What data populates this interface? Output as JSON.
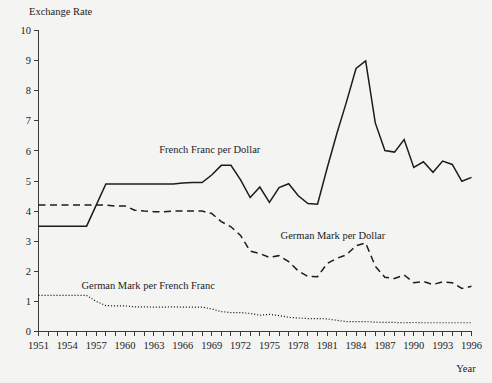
{
  "chart_data": {
    "type": "line",
    "title": "",
    "ylabel": "Exchange Rate",
    "xlabel": "Year",
    "ylim": [
      0,
      10
    ],
    "xlim": [
      1951,
      1996
    ],
    "grid": false,
    "legend_position": "inline-annotations",
    "ytick_labels": [
      "0",
      "1",
      "2",
      "3",
      "4",
      "5",
      "6",
      "7",
      "8",
      "9",
      "10"
    ],
    "ytick_values": [
      0,
      1,
      2,
      3,
      4,
      5,
      6,
      7,
      8,
      9,
      10
    ],
    "xtick_labels": [
      "1951",
      "1954",
      "1957",
      "1960",
      "1963",
      "1966",
      "1969",
      "1972",
      "1975",
      "1978",
      "1981",
      "1984",
      "1987",
      "1990",
      "1993",
      "1996"
    ],
    "xtick_values": [
      1951,
      1954,
      1957,
      1960,
      1963,
      1966,
      1969,
      1972,
      1975,
      1978,
      1981,
      1984,
      1987,
      1990,
      1993,
      1996
    ],
    "x": [
      1951,
      1952,
      1953,
      1954,
      1955,
      1956,
      1957,
      1958,
      1959,
      1960,
      1961,
      1962,
      1963,
      1964,
      1965,
      1966,
      1967,
      1968,
      1969,
      1970,
      1971,
      1972,
      1973,
      1974,
      1975,
      1976,
      1977,
      1978,
      1979,
      1980,
      1981,
      1982,
      1983,
      1984,
      1985,
      1986,
      1987,
      1988,
      1989,
      1990,
      1991,
      1992,
      1993,
      1994,
      1995,
      1996
    ],
    "series": [
      {
        "name": "French Franc per Dollar",
        "style": "solid",
        "label_text": "French Franc per Dollar",
        "values": [
          3.5,
          3.5,
          3.5,
          3.5,
          3.5,
          3.5,
          4.2,
          4.9,
          4.9,
          4.9,
          4.9,
          4.9,
          4.9,
          4.9,
          4.9,
          4.93,
          4.95,
          4.95,
          5.2,
          5.52,
          5.52,
          5.04,
          4.45,
          4.8,
          4.29,
          4.78,
          4.91,
          4.51,
          4.25,
          4.23,
          5.43,
          6.57,
          7.62,
          8.74,
          8.99,
          6.93,
          6.01,
          5.96,
          6.38,
          5.45,
          5.64,
          5.29,
          5.66,
          5.55,
          4.99,
          5.12
        ]
      },
      {
        "name": "German Mark per Dollar",
        "style": "dashed",
        "label_text": "German Mark per Dollar",
        "values": [
          4.2,
          4.2,
          4.2,
          4.2,
          4.2,
          4.2,
          4.2,
          4.2,
          4.17,
          4.17,
          4.03,
          4.0,
          3.98,
          3.98,
          4.0,
          4.0,
          4.0,
          4.0,
          3.92,
          3.65,
          3.48,
          3.19,
          2.67,
          2.59,
          2.46,
          2.52,
          2.32,
          2.01,
          1.83,
          1.82,
          2.26,
          2.43,
          2.55,
          2.85,
          2.94,
          2.17,
          1.8,
          1.76,
          1.88,
          1.62,
          1.66,
          1.56,
          1.65,
          1.62,
          1.43,
          1.5
        ]
      },
      {
        "name": "German Mark per French Franc",
        "style": "dotted",
        "label_text": "German Mark per French Franc",
        "values": [
          1.2,
          1.2,
          1.2,
          1.2,
          1.2,
          1.2,
          1.0,
          0.86,
          0.85,
          0.85,
          0.82,
          0.82,
          0.81,
          0.81,
          0.82,
          0.81,
          0.81,
          0.81,
          0.75,
          0.66,
          0.63,
          0.63,
          0.6,
          0.54,
          0.57,
          0.53,
          0.47,
          0.45,
          0.43,
          0.43,
          0.42,
          0.37,
          0.33,
          0.33,
          0.33,
          0.31,
          0.3,
          0.3,
          0.29,
          0.3,
          0.29,
          0.29,
          0.29,
          0.29,
          0.29,
          0.29
        ]
      }
    ],
    "annotations": [
      {
        "text": "French Franc per Dollar",
        "x_year": 1968.8,
        "y_value": 5.92
      },
      {
        "text": "German Mark per Dollar",
        "x_year": 1981.6,
        "y_value": 3.07
      },
      {
        "text": "German Mark per French Franc",
        "x_year": 1962.4,
        "y_value": 1.4
      }
    ],
    "colors": {
      "line": "#1c1c1c",
      "axis": "#3a3a3a",
      "background": "#f4f4f2"
    }
  }
}
